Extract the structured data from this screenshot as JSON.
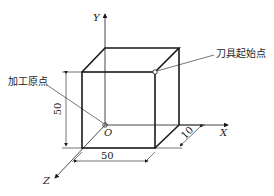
{
  "labels": {
    "origin_label": "加工原点",
    "tool_start_label": "刀具起始点",
    "origin_point": "O"
  },
  "axes": {
    "x": "X",
    "y": "Y",
    "z": "Z"
  },
  "dimensions": {
    "width": "50",
    "height": "50",
    "depth": "10"
  },
  "colors": {
    "line": "#1a1a1a"
  }
}
